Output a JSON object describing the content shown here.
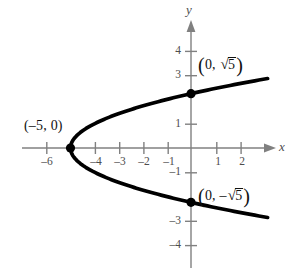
{
  "figure": {
    "kind": "coordinate-plane-graph",
    "background_color": "#ffffff",
    "axis_color": "#808080",
    "curve_color": "#000000",
    "text_color": "#4d4d4d"
  },
  "axes": {
    "x_axis_label": "x",
    "y_axis_label": "y",
    "x_ticks": [
      {
        "value": -6,
        "label": "–6"
      },
      {
        "value": -4,
        "label": "–4"
      },
      {
        "value": -3,
        "label": "–3"
      },
      {
        "value": -2,
        "label": "–2"
      },
      {
        "value": -1,
        "label": "–1"
      },
      {
        "value": 1,
        "label": "1"
      },
      {
        "value": 2,
        "label": "2"
      }
    ],
    "y_ticks": [
      {
        "value": 4,
        "label": "4"
      },
      {
        "value": 3,
        "label": "3"
      },
      {
        "value": 1,
        "label": "1"
      },
      {
        "value": -1,
        "label": "–1"
      },
      {
        "value": -3,
        "label": "–3"
      },
      {
        "value": -4,
        "label": "–4"
      }
    ]
  },
  "annotations": {
    "vertex_label": "(–5, 0)",
    "upper_intercept": {
      "open_paren": "(",
      "zero": "0,",
      "radical_sign": "√",
      "radicand": "5",
      "close_paren": ")"
    },
    "lower_intercept": {
      "open_paren": "(",
      "zero": "0,",
      "minus": "–",
      "radical_sign": "√",
      "radicand": "5",
      "close_paren": ")"
    }
  },
  "chart_data": {
    "type": "line",
    "title": "",
    "xlabel": "x",
    "ylabel": "y",
    "xlim": [
      -7.9,
      4.2
    ],
    "ylim": [
      -5.2,
      5.3
    ],
    "grid": false,
    "legend": "none",
    "equation": "x = y^2 - 5",
    "series": [
      {
        "name": "parabola x = y^2 - 5",
        "orientation": "opens-right",
        "x": [
          -5.0,
          -4.75,
          -4.44,
          -4.0,
          -3.44,
          -2.75,
          -1.94,
          -1.0,
          0.0,
          1.06,
          2.25,
          3.06
        ],
        "y": [
          0.0,
          0.5,
          0.75,
          1.0,
          1.25,
          1.5,
          1.75,
          2.0,
          2.236,
          2.46,
          2.69,
          2.84
        ]
      },
      {
        "name": "parabola x = y^2 - 5 (lower branch)",
        "orientation": "opens-right",
        "x": [
          -5.0,
          -4.75,
          -4.44,
          -4.0,
          -3.44,
          -2.75,
          -1.94,
          -1.0,
          0.0,
          1.06,
          2.25,
          3.06
        ],
        "y": [
          0.0,
          -0.5,
          -0.75,
          -1.0,
          -1.25,
          -1.5,
          -1.75,
          -2.0,
          -2.236,
          -2.46,
          -2.69,
          -2.84
        ]
      }
    ],
    "points": [
      {
        "name": "vertex",
        "x": -5,
        "y": 0,
        "label": "(–5, 0)",
        "marked": true
      },
      {
        "name": "upper-y-intercept",
        "x": 0,
        "y": 2.236,
        "label": "(0, √5)",
        "marked": true
      },
      {
        "name": "lower-y-intercept",
        "x": 0,
        "y": -2.236,
        "label": "(0, –√5)",
        "marked": true
      }
    ]
  }
}
